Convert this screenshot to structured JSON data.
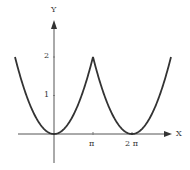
{
  "chart_data": {
    "type": "line",
    "title": "",
    "xlabel": "X",
    "ylabel": "Y",
    "x_ticks": [
      {
        "label": "π",
        "value": 3.14159
      },
      {
        "label": "2 π",
        "value": 6.28319
      }
    ],
    "y_ticks": [
      {
        "label": "1",
        "value": 1
      },
      {
        "label": "2",
        "value": 2
      }
    ],
    "xlim": [
      -3.14159,
      7.85
    ],
    "ylim": [
      -0.75,
      3
    ],
    "grid": false,
    "legend": "none",
    "series": [
      {
        "name": "f(x) = 2(x/π)², 2π-periodic",
        "x": [
          -3.14159,
          -2.35619,
          -1.5708,
          -0.7854,
          0,
          0.7854,
          1.5708,
          2.35619,
          3.14159,
          3.92699,
          4.71239,
          5.49779,
          6.28319,
          7.06858,
          7.85398,
          8.63938,
          9.42478
        ],
        "y": [
          2,
          1.125,
          0.5,
          0.125,
          0,
          0.125,
          0.5,
          1.125,
          2,
          1.125,
          0.5,
          0.125,
          0,
          0.125,
          0.5,
          1.125,
          2
        ]
      }
    ]
  },
  "labels": {
    "x_axis": "X",
    "y_axis": "Y",
    "tick_pi": "π",
    "tick_2pi": "2 π",
    "tick_1": "1",
    "tick_2": "2"
  },
  "colors": {
    "curve": "#333333",
    "axis": "#555555"
  }
}
